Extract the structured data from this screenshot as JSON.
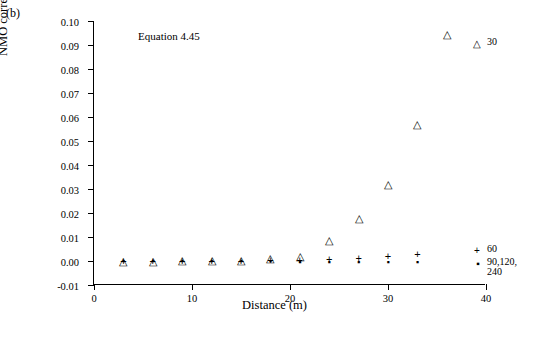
{
  "panel": {
    "label": "(b)"
  },
  "annotation": {
    "equation": "Equation 4.45"
  },
  "axes": {
    "xlabel": "Distance (m)",
    "ylabel": "NMO correction error (ms)",
    "xticks": [
      "0",
      "10",
      "20",
      "30",
      "40"
    ],
    "yticks": [
      "-0.01",
      "0.00",
      "0.01",
      "0.02",
      "0.03",
      "0.04",
      "0.05",
      "0.06",
      "0.07",
      "0.08",
      "0.09",
      "0.10"
    ]
  },
  "legend": [
    {
      "symbol": "△",
      "label": "30"
    },
    {
      "symbol": "+",
      "label": "60"
    },
    {
      "symbol": "▪",
      "label": "90,120,"
    },
    {
      "symbol": "",
      "label": "240"
    }
  ],
  "chart_data": {
    "type": "scatter",
    "title": "",
    "xlabel": "Distance (m)",
    "ylabel": "NMO correction error (ms)",
    "xlim": [
      0,
      40
    ],
    "ylim": [
      -0.01,
      0.1
    ],
    "xticks": [
      0,
      10,
      20,
      30,
      40
    ],
    "yticks": [
      -0.01,
      0.0,
      0.01,
      0.02,
      0.03,
      0.04,
      0.05,
      0.06,
      0.07,
      0.08,
      0.09,
      0.1
    ],
    "grid": false,
    "legend_position": "right-inside",
    "annotations": [
      {
        "text": "Equation 4.45",
        "x": 4.5,
        "y": 0.0935
      }
    ],
    "series": [
      {
        "name": "30",
        "marker": "triangle",
        "x": [
          3,
          6,
          9,
          12,
          15,
          18,
          21,
          24,
          27,
          30,
          33,
          36
        ],
        "y": [
          0.0002,
          0.0002,
          0.0003,
          0.0004,
          0.0006,
          0.0012,
          0.0022,
          0.0088,
          0.0178,
          0.0322,
          0.057,
          0.0945
        ]
      },
      {
        "name": "60",
        "marker": "plus",
        "x": [
          3,
          6,
          9,
          12,
          15,
          18,
          21,
          24,
          27,
          30,
          33
        ],
        "y": [
          0.0001,
          0.0001,
          0.0001,
          0.0002,
          0.0002,
          0.0004,
          0.0005,
          0.0009,
          0.0014,
          0.002,
          0.003
        ]
      },
      {
        "name": "90,120,240",
        "marker": "square",
        "x": [
          3,
          6,
          9,
          12,
          15,
          18,
          21,
          24,
          27,
          30,
          33
        ],
        "y": [
          0.0,
          0.0,
          0.0,
          0.0,
          0.0,
          -0.0002,
          -0.0003,
          -0.0005,
          -0.0005,
          -0.0005,
          -0.0006
        ]
      }
    ]
  }
}
